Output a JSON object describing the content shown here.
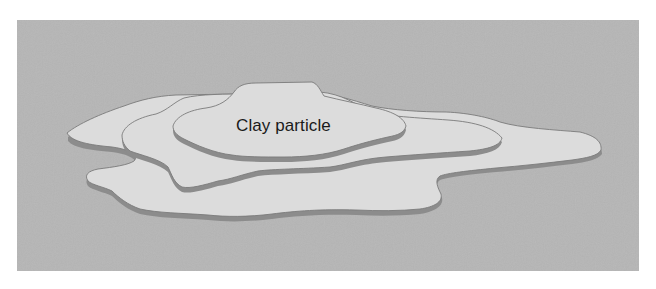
{
  "diagram": {
    "label": "Clay particle",
    "layers": [
      {
        "name": "bottom-plate"
      },
      {
        "name": "middle-plate"
      },
      {
        "name": "top-plate"
      }
    ]
  },
  "colors": {
    "page_background": "#ffffff",
    "panel_background": "#b6b6b6",
    "plate_face": "#dcdcdc",
    "plate_edge": "#8c8c8c",
    "outline": "#7a7a7a",
    "label_text": "#1a1a1a"
  }
}
